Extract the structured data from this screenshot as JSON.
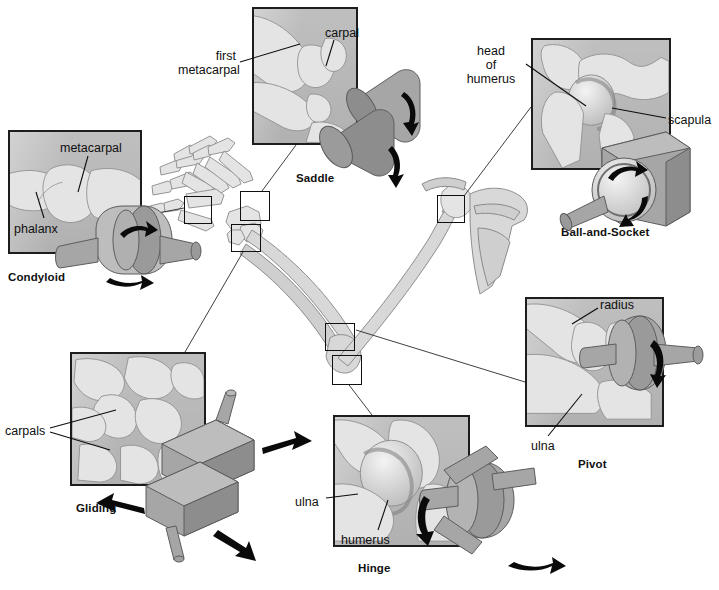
{
  "figure": {
    "background_color": "#ffffff",
    "panel_fill": "#c9c9c9",
    "panel_border": "#1d1d1d",
    "mechanical_model_color": "#a6a6a6",
    "bone_color": "#d8d8d8",
    "arrow_color": "#0a0a0a"
  },
  "joints": [
    {
      "id": "saddle",
      "title": "Saddle",
      "title_pos": {
        "x": 296,
        "y": 172
      },
      "panel": {
        "x": 252,
        "y": 7,
        "w": 106,
        "h": 138
      },
      "labels": [
        {
          "text_line1": "first",
          "text_line2": "metacarpal",
          "x": 178,
          "y": 56
        },
        {
          "text_line1": "carpal",
          "text_line2": "",
          "x": 325,
          "y": 26
        }
      ]
    },
    {
      "id": "condyloid",
      "title": "Condyloid",
      "title_pos": {
        "x": 8,
        "y": 271
      },
      "panel": {
        "x": 8,
        "y": 130,
        "w": 134,
        "h": 124
      },
      "labels": [
        {
          "text_line1": "metacarpal",
          "text_line2": "",
          "x": 60,
          "y": 141
        },
        {
          "text_line1": "phalanx",
          "text_line2": "",
          "x": 14,
          "y": 222
        }
      ]
    },
    {
      "id": "ball-and-socket",
      "title": "Ball-and-Socket",
      "title_pos": {
        "x": 561,
        "y": 226
      },
      "panel": {
        "x": 531,
        "y": 38,
        "w": 140,
        "h": 132
      },
      "labels": [
        {
          "text_line1": "head",
          "text_line2": "of",
          "text_line3": "humerus",
          "x": 462,
          "y": 49
        },
        {
          "text_line1": "scapula",
          "text_line2": "",
          "x": 668,
          "y": 113
        }
      ]
    },
    {
      "id": "pivot",
      "title": "Pivot",
      "title_pos": {
        "x": 578,
        "y": 458
      },
      "panel": {
        "x": 525,
        "y": 297,
        "w": 139,
        "h": 130
      },
      "labels": [
        {
          "text_line1": "radius",
          "text_line2": "",
          "x": 600,
          "y": 298
        },
        {
          "text_line1": "ulna",
          "text_line2": "",
          "x": 531,
          "y": 439
        }
      ]
    },
    {
      "id": "hinge",
      "title": "Hinge",
      "title_pos": {
        "x": 358,
        "y": 562
      },
      "panel": {
        "x": 333,
        "y": 415,
        "w": 137,
        "h": 132
      },
      "labels": [
        {
          "text_line1": "ulna",
          "text_line2": "",
          "x": 295,
          "y": 495
        },
        {
          "text_line1": "humerus",
          "text_line2": "",
          "x": 341,
          "y": 533
        }
      ]
    },
    {
      "id": "gliding",
      "title": "Gliding",
      "title_pos": {
        "x": 76,
        "y": 502
      },
      "panel": {
        "x": 70,
        "y": 352,
        "w": 136,
        "h": 134
      },
      "labels": [
        {
          "text_line1": "carpals",
          "text_line2": "",
          "x": 5,
          "y": 424
        }
      ]
    }
  ],
  "highlight_boxes": [
    {
      "name": "condyloid-site",
      "x": 184,
      "y": 196,
      "w": 28,
      "h": 28
    },
    {
      "name": "saddle-site",
      "x": 240,
      "y": 191,
      "w": 30,
      "h": 30
    },
    {
      "name": "gliding-site",
      "x": 231,
      "y": 224,
      "w": 30,
      "h": 28
    },
    {
      "name": "ball-socket-site",
      "x": 437,
      "y": 195,
      "w": 28,
      "h": 28
    },
    {
      "name": "pivot-site",
      "x": 325,
      "y": 323,
      "w": 30,
      "h": 28
    },
    {
      "name": "hinge-site",
      "x": 332,
      "y": 355,
      "w": 30,
      "h": 30
    }
  ],
  "connectors": [
    {
      "from": "condyloid-panel",
      "to": "condyloid-site"
    },
    {
      "from": "saddle-panel",
      "to": "saddle-site"
    },
    {
      "from": "gliding-panel",
      "to": "gliding-site"
    },
    {
      "from": "ball-socket-panel",
      "to": "ball-socket-site"
    },
    {
      "from": "pivot-panel",
      "to": "pivot-site"
    },
    {
      "from": "hinge-panel",
      "to": "hinge-site"
    }
  ],
  "skeleton": {
    "parts": [
      "hand",
      "radius",
      "ulna",
      "humerus",
      "scapula",
      "clavicle"
    ]
  }
}
